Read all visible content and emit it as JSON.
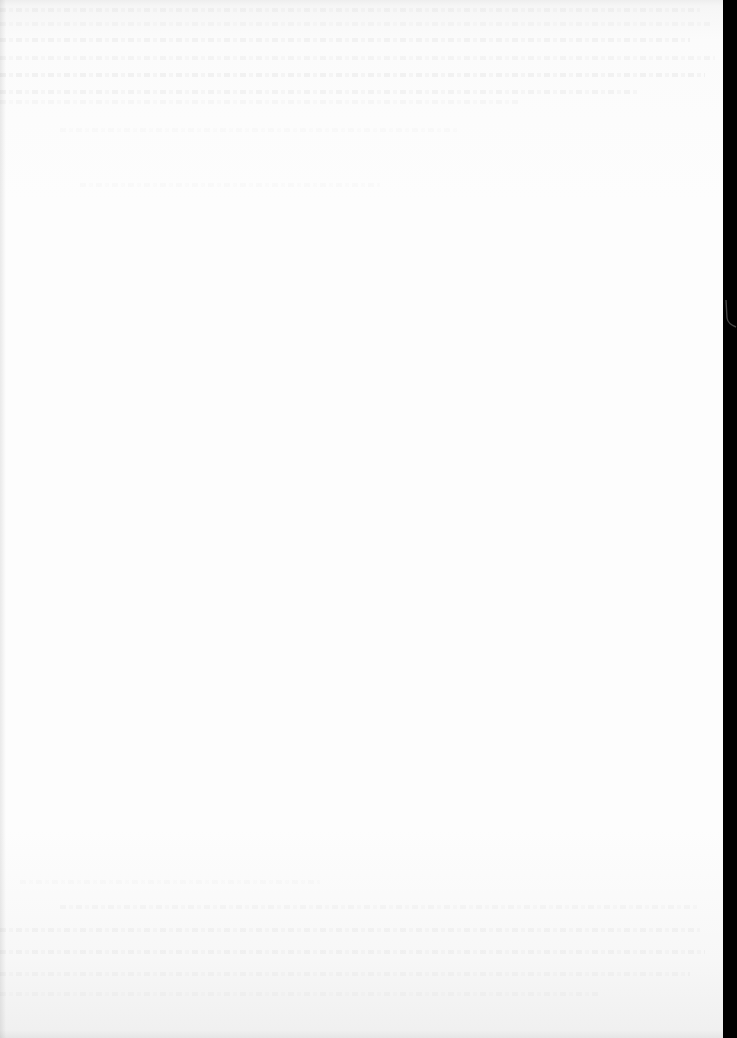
{
  "document": {
    "type": "blank scanned page",
    "legible_text": [],
    "colors": {
      "paper": "#fdfdfd",
      "edge_strip": "#000000"
    }
  }
}
